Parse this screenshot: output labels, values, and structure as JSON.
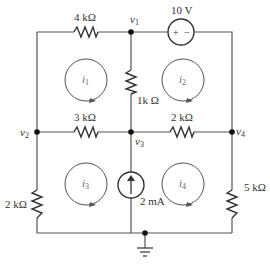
{
  "diagram": {
    "type": "circuit-schematic",
    "colors": {
      "wire": "#555555",
      "text": "#333333",
      "node": "#111111"
    },
    "resistors": [
      {
        "id": "R_top_left",
        "label": "4 kΩ"
      },
      {
        "id": "R_vertical_center",
        "label": "1k Ω"
      },
      {
        "id": "R_mid_left",
        "label": "3 kΩ"
      },
      {
        "id": "R_mid_right",
        "label": "2 kΩ"
      },
      {
        "id": "R_left_bottom",
        "label": "2 kΩ"
      },
      {
        "id": "R_right_bottom",
        "label": "5 kΩ"
      }
    ],
    "sources": {
      "voltage": {
        "label": "10 V",
        "plus": "+",
        "minus": "−"
      },
      "current": {
        "label": "2 mA"
      }
    },
    "nodes": [
      {
        "name": "v",
        "sub": "1"
      },
      {
        "name": "v",
        "sub": "2"
      },
      {
        "name": "v",
        "sub": "3"
      },
      {
        "name": "v",
        "sub": "4"
      }
    ],
    "mesh_currents": [
      {
        "name": "i",
        "sub": "1"
      },
      {
        "name": "i",
        "sub": "2"
      },
      {
        "name": "i",
        "sub": "3"
      },
      {
        "name": "i",
        "sub": "4"
      }
    ]
  }
}
